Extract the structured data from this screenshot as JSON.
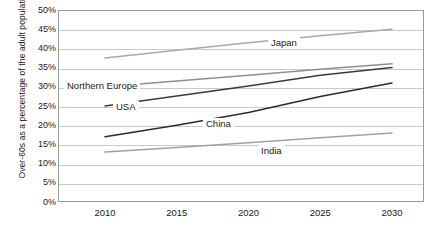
{
  "chart_data": {
    "type": "line",
    "title": "",
    "xlabel": "",
    "ylabel": "Over-60s as a percentage of the adult population",
    "x": [
      2010,
      2015,
      2020,
      2025,
      2030
    ],
    "xticklabels": [
      "2010",
      "2015",
      "2020",
      "2025",
      "2030"
    ],
    "yticklabels": [
      "50%",
      "45%",
      "40%",
      "35%",
      "30%",
      "25%",
      "20%",
      "15%",
      "10%",
      "5%",
      "0%"
    ],
    "ytickvalues": [
      50,
      45,
      40,
      35,
      30,
      25,
      20,
      15,
      10,
      5,
      0
    ],
    "ylim": [
      0,
      50
    ],
    "xlim": [
      2010,
      2030
    ],
    "grid": true,
    "legend_position": "inline-labels",
    "series": [
      {
        "name": "Japan",
        "color": "#a8a8a8",
        "values": [
          37.5,
          39.5,
          41.5,
          43.3,
          45.0
        ],
        "label_x": 268,
        "label_y": 37
      },
      {
        "name": "Northern Europe",
        "color": "#8f8f8f",
        "values": [
          30.0,
          31.5,
          33.0,
          34.6,
          36.0
        ],
        "label_x": 64,
        "label_y": 80
      },
      {
        "name": "USA",
        "color": "#3a3a3a",
        "values": [
          25.0,
          27.6,
          30.2,
          33.0,
          35.0
        ],
        "label_x": 113,
        "label_y": 101
      },
      {
        "name": "China",
        "color": "#2b2b2b",
        "values": [
          17.0,
          20.0,
          23.3,
          27.5,
          31.0
        ],
        "label_x": 203,
        "label_y": 118
      },
      {
        "name": "India",
        "color": "#a0a0a0",
        "values": [
          13.0,
          14.2,
          15.4,
          16.7,
          18.0
        ],
        "label_x": 258,
        "label_y": 145
      }
    ]
  }
}
